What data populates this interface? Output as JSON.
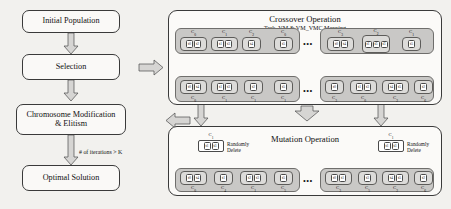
{
  "canvas": {
    "width": 451,
    "height": 209,
    "background": "#f2f1ee"
  },
  "flow": {
    "nodes": [
      {
        "id": "initial-population",
        "label": "Initial Population"
      },
      {
        "id": "selection",
        "label": "Selection"
      },
      {
        "id": "chromosome-modification",
        "label_line1": "Chromosome Modification",
        "label_line2": "& Elitism"
      },
      {
        "id": "optimal-solution",
        "label": "Optimal Solution"
      }
    ],
    "condition_label": "# of iterations > K"
  },
  "crossover": {
    "title": "Crossover Operation",
    "subtitle": "Task_VM & VM_VMC Mapping",
    "ellipsis": "•••",
    "parents": {
      "left": {
        "groups": [
          {
            "label": "C",
            "index": "0",
            "cells": [
              "t0",
              "t2"
            ]
          },
          {
            "label": "C",
            "index": "1",
            "cells": [
              "t1",
              "t3"
            ]
          },
          {
            "label": "C",
            "index": "2",
            "cells": [
              "t4"
            ]
          },
          {
            "label": "C",
            "index": "0",
            "cells": [
              "t5"
            ]
          }
        ]
      },
      "right": {
        "groups": [
          {
            "label": "C",
            "index": "3",
            "cells": [
              "t0",
              "t4"
            ]
          },
          {
            "label": "C",
            "index": "2",
            "cells": [
              "t1",
              "t5",
              "t3"
            ]
          },
          {
            "label": "C",
            "index": "1",
            "cells": [
              "t5"
            ]
          }
        ]
      }
    },
    "offspring": {
      "left": {
        "groups": [
          {
            "cells": [
              "t0",
              "t4"
            ],
            "label": "C",
            "index": "0"
          },
          {
            "cells": [
              "t1",
              "t3"
            ],
            "label": "C",
            "index": "1"
          },
          {
            "cells": [
              "t2"
            ],
            "label": "C",
            "index": "1"
          },
          {
            "cells": [
              "t5"
            ],
            "label": "C",
            "index": "1"
          }
        ]
      },
      "right": {
        "groups": [
          {
            "cells": [
              "t0"
            ],
            "label": "C",
            "index": "3"
          },
          {
            "cells": [
              "t1",
              "t3"
            ],
            "label": "C",
            "index": "0"
          },
          {
            "cells": [
              "t4",
              "t5"
            ],
            "label": "C",
            "index": "2"
          },
          {
            "cells": [
              "t2"
            ],
            "label": "C",
            "index": "6"
          }
        ]
      }
    }
  },
  "mutation": {
    "title": "Mutation Operation",
    "ellipsis": "•••",
    "detail_left": {
      "label": "C",
      "index": "1",
      "cells": [
        "t1",
        "t3"
      ],
      "note_line1": "Randomly",
      "note_line2": "Delete"
    },
    "detail_right": {
      "label": "C",
      "index": "1",
      "cells": [
        "t1",
        "t3"
      ],
      "note_line1": "Randomly",
      "note_line2": "Delete"
    },
    "left": {
      "groups": [
        {
          "cells": [
            "t0",
            "t4"
          ],
          "label": "C",
          "index": "0"
        },
        {
          "cells": [
            "t1"
          ],
          "label": "C",
          "index": "4"
        },
        {
          "cells": [
            "t2",
            "t3"
          ],
          "label": "C",
          "index": "1"
        },
        {
          "cells": [
            "t5"
          ],
          "label": "C",
          "index": "5"
        }
      ]
    },
    "right": {
      "groups": [
        {
          "cells": [
            "t0",
            "t1"
          ],
          "label": "C",
          "index": "3"
        },
        {
          "cells": [
            "t3"
          ],
          "label": "C",
          "index": "5"
        },
        {
          "cells": [
            "t4",
            "t5"
          ],
          "label": "C",
          "index": "2"
        },
        {
          "cells": [
            "t2"
          ],
          "label": "C",
          "index": "6"
        }
      ]
    }
  }
}
